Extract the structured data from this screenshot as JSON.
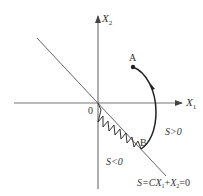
{
  "header_clip": "",
  "axes": {
    "x_label": "X",
    "x_sub": "1",
    "y_label": "X",
    "y_sub": "2",
    "origin_label": "0"
  },
  "points": {
    "a_label": "A",
    "b_label": "B"
  },
  "regions": {
    "positive": "S>0",
    "negative": "S<0"
  },
  "switching_line": {
    "prefix": "S=C",
    "x1": "X",
    "x1_sub": "1",
    "plus": "+",
    "x2": "X",
    "x2_sub": "2",
    "suffix": "=0"
  },
  "colors": {
    "axis": "#666666",
    "line": "#555555",
    "trajectory": "#222222"
  }
}
